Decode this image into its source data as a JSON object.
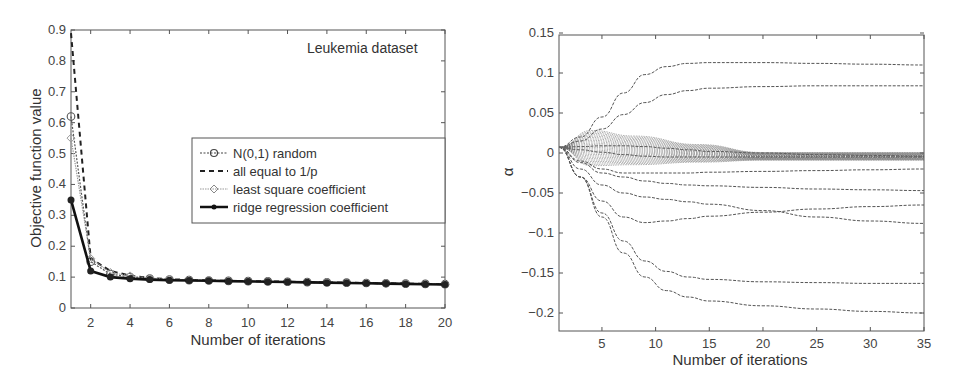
{
  "chart_data": [
    {
      "type": "line",
      "title": "",
      "annotation": "Leukemia dataset",
      "xlabel": "Number of iterations",
      "ylabel": "Objective function value",
      "xlim": [
        1,
        20
      ],
      "ylim": [
        0,
        0.9
      ],
      "xticks": [
        2,
        4,
        6,
        8,
        10,
        12,
        14,
        16,
        18,
        20
      ],
      "yticks": [
        0,
        0.1,
        0.2,
        0.3,
        0.4,
        0.5,
        0.6,
        0.7,
        0.8,
        0.9
      ],
      "grid": false,
      "legend_position": "center-right",
      "x": [
        1,
        2,
        3,
        4,
        5,
        6,
        7,
        8,
        9,
        10,
        11,
        12,
        13,
        14,
        15,
        16,
        17,
        18,
        19,
        20
      ],
      "series": [
        {
          "name": "N(0,1) random",
          "style": "dotted-circle-marker",
          "values": [
            0.62,
            0.15,
            0.11,
            0.1,
            0.095,
            0.092,
            0.09,
            0.089,
            0.088,
            0.087,
            0.086,
            0.085,
            0.084,
            0.083,
            0.082,
            0.081,
            0.08,
            0.079,
            0.078,
            0.077
          ]
        },
        {
          "name": "all equal to 1/p",
          "style": "dashed",
          "values": [
            0.89,
            0.16,
            0.12,
            0.105,
            0.097,
            0.093,
            0.091,
            0.089,
            0.088,
            0.087,
            0.086,
            0.085,
            0.084,
            0.083,
            0.082,
            0.081,
            0.08,
            0.079,
            0.078,
            0.077
          ]
        },
        {
          "name": "least square coefficient",
          "style": "dotted-diamond-marker",
          "values": [
            0.55,
            0.16,
            0.115,
            0.104,
            0.097,
            0.093,
            0.091,
            0.089,
            0.088,
            0.087,
            0.086,
            0.085,
            0.084,
            0.083,
            0.082,
            0.081,
            0.08,
            0.079,
            0.078,
            0.077
          ]
        },
        {
          "name": "ridge regression coefficient",
          "style": "solid-star-marker",
          "values": [
            0.35,
            0.12,
            0.1,
            0.095,
            0.092,
            0.09,
            0.089,
            0.088,
            0.087,
            0.086,
            0.085,
            0.084,
            0.083,
            0.082,
            0.081,
            0.08,
            0.079,
            0.078,
            0.077,
            0.076
          ]
        }
      ]
    },
    {
      "type": "line",
      "title": "",
      "xlabel": "Number of iterations",
      "ylabel": "α",
      "xlim": [
        1,
        35
      ],
      "ylim": [
        -0.22,
        0.15
      ],
      "xticks": [
        5,
        10,
        15,
        20,
        25,
        30,
        35
      ],
      "yticks": [
        0.15,
        0.1,
        0.05,
        0,
        -0.05,
        -0.1,
        -0.15,
        -0.2
      ],
      "grid": false,
      "legend_position": "none",
      "x": [
        1,
        3,
        5,
        7,
        9,
        11,
        13,
        15,
        20,
        25,
        30,
        35
      ],
      "series": [
        {
          "name": "coef-1",
          "values": [
            0.007,
            0.02,
            0.045,
            0.075,
            0.098,
            0.108,
            0.112,
            0.113,
            0.113,
            0.112,
            0.111,
            0.11
          ]
        },
        {
          "name": "coef-2",
          "values": [
            0.007,
            0.015,
            0.03,
            0.048,
            0.063,
            0.073,
            0.078,
            0.081,
            0.083,
            0.084,
            0.084,
            0.084
          ]
        },
        {
          "name": "coef-3",
          "values": [
            0.007,
            0.008,
            0.009,
            0.009,
            0.008,
            0.006,
            0.004,
            0.002,
            0.0,
            -0.002,
            -0.003,
            -0.004
          ]
        },
        {
          "name": "coef-4",
          "values": [
            0.007,
            0.004,
            0.001,
            -0.002,
            -0.004,
            -0.005,
            -0.005,
            -0.005,
            -0.005,
            -0.005,
            -0.005,
            -0.005
          ]
        },
        {
          "name": "coef-5",
          "values": [
            0.007,
            -0.01,
            -0.02,
            -0.025,
            -0.025,
            -0.025,
            -0.025,
            -0.024,
            -0.023,
            -0.022,
            -0.021,
            -0.02
          ]
        },
        {
          "name": "coef-6",
          "values": [
            0.007,
            -0.012,
            -0.025,
            -0.03,
            -0.035,
            -0.038,
            -0.04,
            -0.041,
            -0.043,
            -0.045,
            -0.046,
            -0.047
          ]
        },
        {
          "name": "coef-7",
          "values": [
            0.007,
            -0.02,
            -0.04,
            -0.05,
            -0.055,
            -0.058,
            -0.061,
            -0.064,
            -0.072,
            -0.08,
            -0.085,
            -0.088
          ]
        },
        {
          "name": "coef-8",
          "values": [
            0.007,
            -0.03,
            -0.06,
            -0.08,
            -0.087,
            -0.085,
            -0.082,
            -0.079,
            -0.074,
            -0.07,
            -0.067,
            -0.065
          ]
        },
        {
          "name": "coef-9",
          "values": [
            0.007,
            -0.03,
            -0.075,
            -0.11,
            -0.135,
            -0.148,
            -0.155,
            -0.158,
            -0.161,
            -0.162,
            -0.163,
            -0.163
          ]
        },
        {
          "name": "coef-10",
          "values": [
            0.007,
            -0.03,
            -0.08,
            -0.125,
            -0.155,
            -0.172,
            -0.18,
            -0.185,
            -0.191,
            -0.195,
            -0.198,
            -0.2
          ]
        }
      ]
    }
  ],
  "left_chart": {
    "annotation": "Leukemia dataset",
    "xlabel": "Number of iterations",
    "ylabel": "Objective function value",
    "xtick_labels": [
      "2",
      "4",
      "6",
      "8",
      "10",
      "12",
      "14",
      "16",
      "18",
      "20"
    ],
    "ytick_labels": [
      "0",
      "0.1",
      "0.2",
      "0.3",
      "0.4",
      "0.5",
      "0.6",
      "0.7",
      "0.8",
      "0.9"
    ],
    "legend": [
      "N(0,1) random",
      "all equal to 1/p",
      "least square coefficient",
      "ridge regression coefficient"
    ]
  },
  "right_chart": {
    "xlabel": "Number of iterations",
    "ylabel": "α",
    "xtick_labels": [
      "5",
      "10",
      "15",
      "20",
      "25",
      "30",
      "35"
    ],
    "ytick_labels": [
      "0.15",
      "0.1",
      "0.05",
      "0",
      "−0.05",
      "−0.1",
      "−0.15",
      "−0.2"
    ]
  }
}
